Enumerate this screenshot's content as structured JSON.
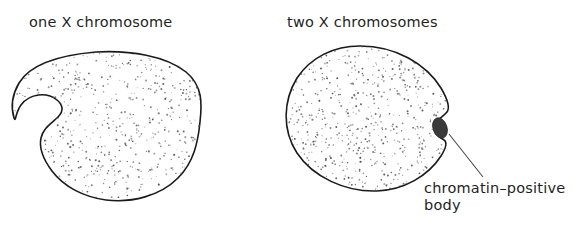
{
  "figure": {
    "background_color": "#ffffff",
    "width": 582,
    "height": 229
  },
  "labels": {
    "left_cell": "one X chromosome",
    "right_cell": "two X chromosomes"
  },
  "annotation": {
    "line1": "chromatin–positive",
    "line2": "body"
  },
  "colors": {
    "outline": "#1a1a1a",
    "stipple": "#555555",
    "barr_body": "#3a3a3a",
    "leader_line": "#4a4a4a",
    "text": "#1f1f1f"
  },
  "shapes": {
    "left_nucleus": {
      "name": "one-x-nucleus",
      "path": "M 96 52 C 130 50 166 56 186 72 C 203 86 202 104 200 122 C 198 142 194 162 178 178 C 160 196 132 203 106 200 C 84 197 64 187 52 171 C 43 159 39 147 41 138 C 43 128 52 123 58 117 C 64 111 63 105 57 100 C 47 92 30 93 21 105 C 15 113 16 123 14 118 C 11 108 12 95 19 83 C 28 68 49 56 96 52 Z"
    },
    "right_nucleus": {
      "name": "two-x-nucleus",
      "path": "M 360 46 C 396 46 426 64 441 88 C 448 100 450 108 447 112 C 444 116 438 118 436 124 C 434 131 438 137 444 140 C 447 142 446 148 441 156 C 428 176 404 190 377 191 C 345 192 313 177 297 153 C 282 130 283 101 297 78 C 311 57 334 46 360 46 Z"
    },
    "barr_body": {
      "name": "chromatin-positive-body",
      "cx": 440,
      "cy": 128,
      "rx": 7,
      "ry": 10.5,
      "rotation": -18
    },
    "leader_line": {
      "name": "annotation-leader-line",
      "path": "M 449 134 L 483 177"
    }
  },
  "stipple": {
    "dot_radius": 0.72,
    "left_count": 760,
    "right_count": 720,
    "seed": 20240517
  }
}
